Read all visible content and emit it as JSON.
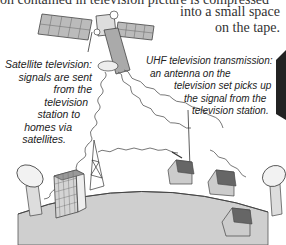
{
  "top_caption": {
    "partial_line": "on contained in television picture is compressed",
    "tape_note_lines": [
      "into a small space",
      "on the tape."
    ]
  },
  "labels": {
    "satellite": {
      "lines": [
        "Satellite television:",
        "signals are sent",
        "from the",
        "television",
        "station to",
        "homes via",
        "satellites."
      ]
    },
    "uhf": {
      "lines": [
        "UHF television transmission:",
        "an antenna on the",
        "television set picks up",
        "the signal from the",
        "television station."
      ]
    }
  },
  "illustration": {
    "elements": [
      "satellite",
      "satellite-dish-left",
      "office-building",
      "transmission-tower",
      "house-with-antenna",
      "house-right",
      "house-lower-right",
      "satellite-dish-right",
      "earth-surface",
      "television-set-edge"
    ],
    "colors": {
      "ground": "#c8c8c8",
      "ground_edge": "#555555",
      "roof": "#666666",
      "wall": "#bdbdbd",
      "line": "#333333"
    }
  }
}
